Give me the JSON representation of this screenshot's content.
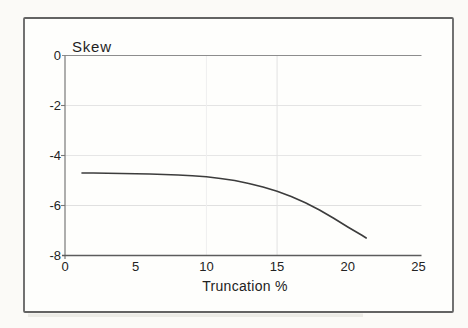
{
  "figure": {
    "background": "#fbfaf7",
    "frame_color": "#636363",
    "plot_background": "#fefefc"
  },
  "chart_data": {
    "type": "line",
    "title": "Skew",
    "xlabel": "Truncation %",
    "ylabel": "Skew",
    "xlim": [
      0,
      25
    ],
    "ylim": [
      -8,
      0
    ],
    "xticks": [
      0,
      5,
      10,
      15,
      20,
      25
    ],
    "yticks": [
      0,
      -2,
      -4,
      -6,
      -8
    ],
    "grid": true,
    "hgridlines": [
      {
        "y": -2,
        "color": "#e4e4e4"
      },
      {
        "y": -4,
        "color": "#e6e6e6"
      },
      {
        "y": -6,
        "color": "#e0e0e0"
      }
    ],
    "vgridlines": [
      {
        "x": 10,
        "color": "#efefef"
      },
      {
        "x": 15,
        "color": "#e2e2e2"
      }
    ],
    "zero_line": {
      "y": 0,
      "color": "#8d8d8d"
    },
    "axis_color": "#5c5c5c",
    "series": [
      {
        "name": "Skew vs Truncation %",
        "color": "#3c3c3c",
        "points": [
          [
            1.2,
            -4.7
          ],
          [
            2,
            -4.7
          ],
          [
            3,
            -4.71
          ],
          [
            4,
            -4.72
          ],
          [
            5,
            -4.73
          ],
          [
            6,
            -4.74
          ],
          [
            7,
            -4.76
          ],
          [
            8,
            -4.78
          ],
          [
            9,
            -4.81
          ],
          [
            10,
            -4.85
          ],
          [
            11,
            -4.92
          ],
          [
            12,
            -5.0
          ],
          [
            13,
            -5.12
          ],
          [
            14,
            -5.26
          ],
          [
            15,
            -5.43
          ],
          [
            16,
            -5.64
          ],
          [
            17,
            -5.89
          ],
          [
            18,
            -6.18
          ],
          [
            19,
            -6.51
          ],
          [
            20,
            -6.86
          ],
          [
            21,
            -7.19
          ],
          [
            21.3,
            -7.3
          ]
        ]
      }
    ]
  }
}
